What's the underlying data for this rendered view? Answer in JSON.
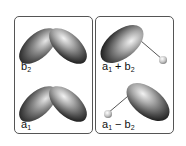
{
  "figure": {
    "colors": {
      "border": "#555555",
      "lobe_dark": "#1a1a1a",
      "lobe_mid": "#6e6e6e",
      "lobe_light": "#e8e8e8",
      "bond_line": "#555555",
      "atom": "#cfcfcf"
    },
    "panels": [
      {
        "id": "left",
        "cells": [
          {
            "id": "b2",
            "label_main": "b",
            "label_sub": "2",
            "shape": "two-lobe-v",
            "label_text": "b2"
          },
          {
            "id": "a1",
            "label_main": "a",
            "label_sub": "1",
            "shape": "two-lobe-v",
            "label_text": "a1"
          }
        ]
      },
      {
        "id": "right",
        "cells": [
          {
            "id": "a1-plus-b2",
            "label_main": "a",
            "label_sub": "1",
            "label_op": " + ",
            "label_main2": "b",
            "label_sub2": "2",
            "shape": "hybrid-upper-left",
            "label_text": "a1 + b2"
          },
          {
            "id": "a1-minus-b2",
            "label_main": "a",
            "label_sub": "1",
            "label_op": " − ",
            "label_main2": "b",
            "label_sub2": "2",
            "shape": "hybrid-lower-right",
            "label_text": "a1 − b2"
          }
        ]
      }
    ]
  }
}
